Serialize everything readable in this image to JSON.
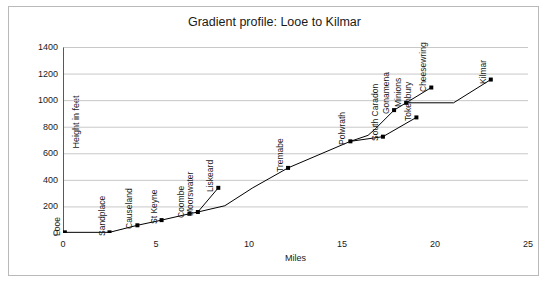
{
  "chart_data": {
    "type": "line",
    "title": "Gradient profile: Looe to Kilmar",
    "xlabel": "Miles",
    "ylabel": "Height in feet",
    "xlim": [
      0,
      25
    ],
    "ylim": [
      0,
      1400
    ],
    "xticks": [
      0,
      5,
      10,
      15,
      20,
      25
    ],
    "yticks": [
      0,
      200,
      400,
      600,
      800,
      1000,
      1200,
      1400
    ],
    "grid": "horizontal",
    "legend": "none",
    "marker": "square",
    "series": [
      {
        "name": "Main line (Looe to Kilmar)",
        "points": [
          {
            "label": "Looe",
            "x": 0.1,
            "y": 5
          },
          {
            "label": "Sandplace",
            "x": 2.5,
            "y": 5
          },
          {
            "label": "Causeland",
            "x": 4.0,
            "y": 58
          },
          {
            "label": "St Keyne",
            "x": 5.3,
            "y": 97
          },
          {
            "label": "Coombe",
            "x": 6.8,
            "y": 145
          },
          {
            "label": "Moorswater",
            "x": 7.25,
            "y": 158
          },
          {
            "label": "",
            "x": 8.7,
            "y": 205
          },
          {
            "label": "",
            "x": 10.2,
            "y": 340
          },
          {
            "label": "Tremabe",
            "x": 12.1,
            "y": 490
          },
          {
            "label": "Polwrath",
            "x": 15.45,
            "y": 690
          },
          {
            "label": "",
            "x": 16.4,
            "y": 735
          },
          {
            "label": "",
            "x": 16.8,
            "y": 785
          },
          {
            "label": "Gonamena",
            "x": 17.8,
            "y": 925
          },
          {
            "label": "Minions",
            "x": 18.45,
            "y": 980
          },
          {
            "label": "",
            "x": 21.0,
            "y": 980
          },
          {
            "label": "Kilmar",
            "x": 23.0,
            "y": 1155
          }
        ]
      },
      {
        "name": "Liskeard branch",
        "points": [
          {
            "label": "",
            "x": 7.25,
            "y": 158
          },
          {
            "label": "Liskeard",
            "x": 8.35,
            "y": 340
          }
        ]
      },
      {
        "name": "Tokenbury branch",
        "points": [
          {
            "label": "",
            "x": 15.45,
            "y": 690
          },
          {
            "label": "South Caradon",
            "x": 17.2,
            "y": 725
          },
          {
            "label": "Tokenbury",
            "x": 19.0,
            "y": 870
          }
        ]
      }
    ],
    "point_labels": [
      {
        "text": "Looe",
        "x": 0.1,
        "y": 5
      },
      {
        "text": "Sandplace",
        "x": 2.5,
        "y": 5
      },
      {
        "text": "Causeland",
        "x": 4.0,
        "y": 58
      },
      {
        "text": "St Keyne",
        "x": 5.3,
        "y": 97
      },
      {
        "text": "Coombe",
        "x": 6.8,
        "y": 145
      },
      {
        "text": "Moorswater",
        "x": 7.25,
        "y": 158
      },
      {
        "text": "Liskeard",
        "x": 8.35,
        "y": 340
      },
      {
        "text": "Tremabe",
        "x": 12.1,
        "y": 490
      },
      {
        "text": "Polwrath",
        "x": 15.45,
        "y": 690
      },
      {
        "text": "South Caradon",
        "x": 17.2,
        "y": 725
      },
      {
        "text": "Gonamena",
        "x": 17.8,
        "y": 925
      },
      {
        "text": "Minions",
        "x": 18.45,
        "y": 980
      },
      {
        "text": "Tokenbury",
        "x": 19.0,
        "y": 870
      },
      {
        "text": "Cheesewring",
        "x": 19.8,
        "y": 1095
      },
      {
        "text": "Kilmar",
        "x": 23.0,
        "y": 1155
      }
    ],
    "extra_points": [
      {
        "label": "Cheesewring",
        "x": 19.8,
        "y": 1095
      }
    ],
    "colors": {
      "line": "#000000",
      "marker": "#000000",
      "grid": "#c8c8c8",
      "axis": "#595959",
      "frame": "#b9b9b9",
      "text": "#1a1a1a"
    }
  }
}
